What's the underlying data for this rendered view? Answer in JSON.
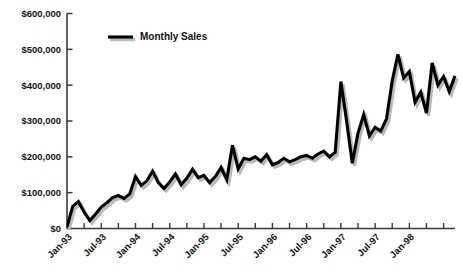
{
  "chart_data": {
    "type": "line",
    "title": "",
    "xlabel": "",
    "ylabel": "",
    "ylim": [
      0,
      600000
    ],
    "grid": false,
    "legend_position": "top-left",
    "y_ticks": [
      0,
      100000,
      200000,
      300000,
      400000,
      500000,
      600000
    ],
    "y_tick_labels": [
      "$0",
      "$100,000",
      "$200,000",
      "$300,000",
      "$400,000",
      "$500,000",
      "$600,000"
    ],
    "x_tick_labels": [
      "Jan-93",
      "Jul-93",
      "Jan-94",
      "Jul-94",
      "Jan-95",
      "Jul-95",
      "Jan-96",
      "Jul-96",
      "Jan-97",
      "Jul-97",
      "Jan-98"
    ],
    "x_tick_label_interval_months": 6,
    "x_minor_tick_interval_months": 3,
    "x_start": "Jan-93",
    "x_end": "Aug-98",
    "series": [
      {
        "name": "Monthly Sales",
        "color": "#000000",
        "values": [
          5000,
          62000,
          75000,
          46000,
          22000,
          40000,
          60000,
          72000,
          86000,
          92000,
          84000,
          96000,
          145000,
          120000,
          133000,
          160000,
          128000,
          112000,
          130000,
          152000,
          122000,
          140000,
          165000,
          142000,
          148000,
          128000,
          145000,
          170000,
          136000,
          232000,
          166000,
          196000,
          192000,
          200000,
          188000,
          206000,
          178000,
          184000,
          196000,
          186000,
          192000,
          200000,
          204000,
          196000,
          208000,
          216000,
          200000,
          212000,
          410000,
          300000,
          182000,
          266000,
          318000,
          258000,
          282000,
          272000,
          306000,
          412000,
          486000,
          420000,
          438000,
          352000,
          380000,
          322000,
          462000,
          400000,
          424000,
          382000,
          426000
        ]
      }
    ]
  },
  "legend": {
    "entries": [
      {
        "label": "Monthly Sales"
      }
    ]
  }
}
